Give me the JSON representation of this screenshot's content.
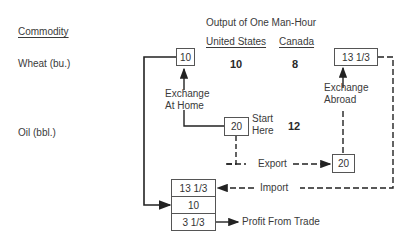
{
  "headers": {
    "commodity": "Commodity",
    "output_title": "Output of One Man-Hour",
    "col_us": "United States",
    "col_canada": "Canada"
  },
  "rows": [
    {
      "commodity": "Wheat (bu.)",
      "us": "10",
      "canada": "8"
    },
    {
      "commodity": "Oil (bbl.)",
      "us": "20",
      "canada": "12"
    }
  ],
  "boxes": {
    "us_wheat": "10",
    "abroad_wheat": "13 1/3",
    "start_oil": "20",
    "export_oil": "20",
    "stack_import": "13 1/3",
    "stack_home": "10",
    "stack_profit": "3 1/3"
  },
  "labels": {
    "exchange_home_1": "Exchange",
    "exchange_home_2": "At Home",
    "exchange_abroad_1": "Exchange",
    "exchange_abroad_2": "Abroad",
    "start_1": "Start",
    "start_2": "Here",
    "export": "Export",
    "import": "Import",
    "profit": "Profit From Trade"
  }
}
